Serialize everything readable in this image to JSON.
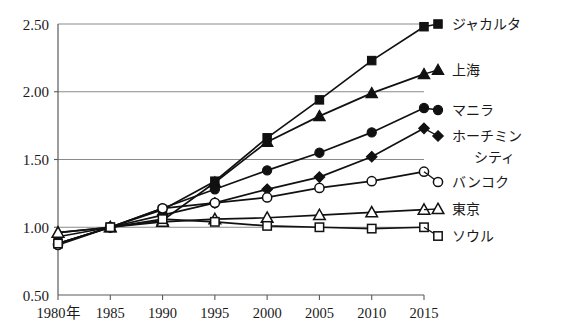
{
  "chart_data": {
    "type": "line",
    "title": "",
    "subtitle": "",
    "xlabel": "",
    "ylabel": "",
    "x": [
      1980,
      1985,
      1990,
      1995,
      2000,
      2005,
      2010,
      2015
    ],
    "categories": [
      "1980年",
      "1985",
      "1990",
      "1995",
      "2000",
      "2005",
      "2010",
      "2015"
    ],
    "xlim": [
      1980,
      2015
    ],
    "ylim": [
      0.5,
      2.5
    ],
    "yticks": [
      0.5,
      1.0,
      1.5,
      2.0,
      2.5
    ],
    "ytick_labels": [
      "0.50",
      "1.00",
      "1.50",
      "2.00",
      "2.50"
    ],
    "grid": "horizontal",
    "legend_position": "right",
    "series": [
      {
        "name": "ジャカルタ",
        "marker": "filled-square",
        "values": [
          0.88,
          1.0,
          1.13,
          1.34,
          1.66,
          1.94,
          2.23,
          2.48
        ]
      },
      {
        "name": "上海",
        "marker": "filled-triangle",
        "values": [
          0.96,
          1.0,
          1.05,
          1.33,
          1.63,
          1.82,
          1.99,
          2.13
        ]
      },
      {
        "name": "マニラ",
        "marker": "filled-circle",
        "values": [
          0.88,
          1.0,
          1.14,
          1.28,
          1.42,
          1.55,
          1.7,
          1.88
        ]
      },
      {
        "name": "ホーチミンシティ",
        "marker": "filled-diamond",
        "values": [
          0.93,
          1.0,
          1.09,
          1.18,
          1.28,
          1.37,
          1.52,
          1.73
        ]
      },
      {
        "name": "バンコク",
        "marker": "open-circle",
        "values": [
          0.87,
          1.0,
          1.14,
          1.18,
          1.22,
          1.29,
          1.34,
          1.41
        ]
      },
      {
        "name": "東京",
        "marker": "open-triangle",
        "values": [
          0.96,
          1.0,
          1.04,
          1.06,
          1.07,
          1.09,
          1.11,
          1.13
        ]
      },
      {
        "name": "ソウル",
        "marker": "open-square",
        "values": [
          0.88,
          1.0,
          1.06,
          1.04,
          1.01,
          1.0,
          0.99,
          1.0
        ]
      }
    ]
  },
  "colors": {
    "line": "#111111",
    "grid": "#8a8a8a",
    "axis": "#5a5a5a",
    "background": "#ffffff",
    "text": "#1a1a1a"
  }
}
